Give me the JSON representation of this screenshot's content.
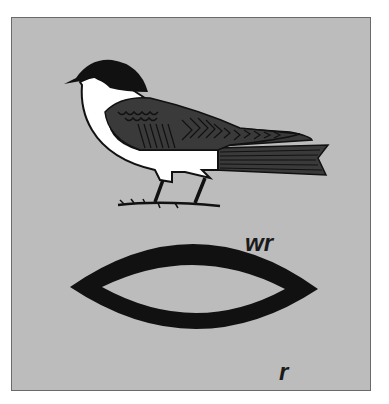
{
  "figure": {
    "glyphs": [
      {
        "name": "swallow",
        "transliteration": "wr"
      },
      {
        "name": "mouth",
        "transliteration": "r"
      }
    ],
    "colors": {
      "background": "#bcbcbc",
      "border": "#6a6a6a",
      "ink": "#111111",
      "wing": "#3a3a3a",
      "white": "#ffffff"
    }
  }
}
